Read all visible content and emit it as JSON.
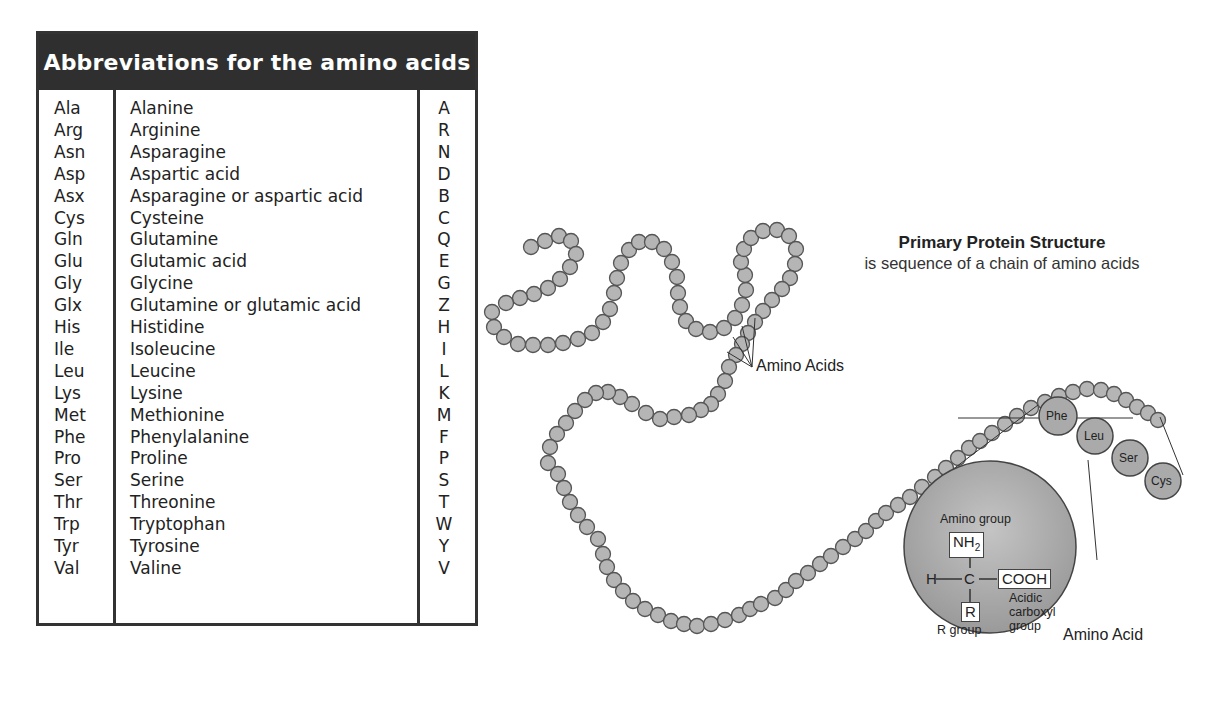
{
  "table": {
    "title": "Abbreviations for the amino acids",
    "rows": [
      {
        "abbr3": "Ala",
        "name": "Alanine",
        "abbr1": "A"
      },
      {
        "abbr3": "Arg",
        "name": "Arginine",
        "abbr1": "R"
      },
      {
        "abbr3": "Asn",
        "name": "Asparagine",
        "abbr1": "N"
      },
      {
        "abbr3": "Asp",
        "name": "Aspartic acid",
        "abbr1": "D"
      },
      {
        "abbr3": "Asx",
        "name": "Asparagine or aspartic acid",
        "abbr1": "B"
      },
      {
        "abbr3": "Cys",
        "name": "Cysteine",
        "abbr1": "C"
      },
      {
        "abbr3": "Gln",
        "name": "Glutamine",
        "abbr1": "Q"
      },
      {
        "abbr3": "Glu",
        "name": "Glutamic acid",
        "abbr1": "E"
      },
      {
        "abbr3": "Gly",
        "name": "Glycine",
        "abbr1": "G"
      },
      {
        "abbr3": "Glx",
        "name": "Glutamine or glutamic acid",
        "abbr1": "Z"
      },
      {
        "abbr3": "His",
        "name": "Histidine",
        "abbr1": "H"
      },
      {
        "abbr3": "Ile",
        "name": "Isoleucine",
        "abbr1": "I"
      },
      {
        "abbr3": "Leu",
        "name": "Leucine",
        "abbr1": "L"
      },
      {
        "abbr3": "Lys",
        "name": "Lysine",
        "abbr1": "K"
      },
      {
        "abbr3": "Met",
        "name": "Methionine",
        "abbr1": "M"
      },
      {
        "abbr3": "Phe",
        "name": "Phenylalanine",
        "abbr1": "F"
      },
      {
        "abbr3": "Pro",
        "name": "Proline",
        "abbr1": "P"
      },
      {
        "abbr3": "Ser",
        "name": "Serine",
        "abbr1": "S"
      },
      {
        "abbr3": "Thr",
        "name": "Threonine",
        "abbr1": "T"
      },
      {
        "abbr3": "Trp",
        "name": "Tryptophan",
        "abbr1": "W"
      },
      {
        "abbr3": "Tyr",
        "name": "Tyrosine",
        "abbr1": "Y"
      },
      {
        "abbr3": "Val",
        "name": "Valine",
        "abbr1": "V"
      }
    ]
  },
  "diagram": {
    "title": "Primary Protein Structure",
    "subtitle": "is sequence of a chain of amino acids",
    "chain_label": "Amino Acids",
    "highlighted_residues": [
      "Phe",
      "Leu",
      "Ser",
      "Cys"
    ],
    "inset": {
      "amino_group_label": "Amino group",
      "nh2": "NH",
      "nh2_sub": "2",
      "h": "H",
      "c": "C",
      "cooh": "COOH",
      "acidic_label_1": "Acidic",
      "acidic_label_2": "carboxyl",
      "acidic_label_3": "group",
      "r": "R",
      "r_group_label": "R group",
      "caption": "Amino Acid"
    },
    "colors": {
      "bead_fill": "#b5b5b5",
      "bead_stroke": "#555555",
      "inset_fill": "#a9a9a9",
      "header_bg": "#2f2f2f"
    }
  }
}
